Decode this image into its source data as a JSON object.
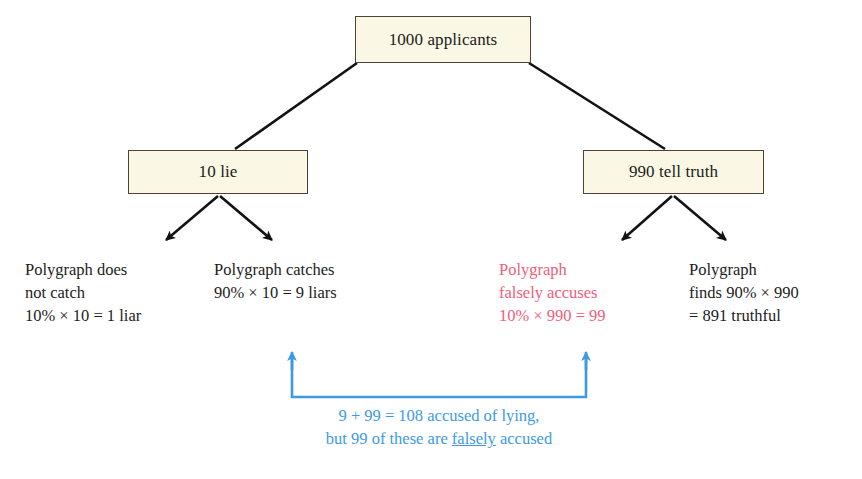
{
  "diagram": {
    "title_text": "Polygraph accuracy tree diagram",
    "colors": {
      "box_fill": "#faf7e4",
      "box_border": "#4a4336",
      "text": "#1c1c1c",
      "highlight_red": "#ef5d7a",
      "annotation_blue": "#3d9ae2",
      "background": "#ffffff"
    },
    "nodes": {
      "root": {
        "label": "1000 applicants"
      },
      "lie": {
        "label": "10 lie"
      },
      "truth": {
        "label": "990 tell truth"
      }
    },
    "leaves": {
      "not_caught": {
        "line1": "Polygraph does",
        "line2": "not catch",
        "line3": "10% × 10 = 1 liar"
      },
      "caught": {
        "line1": "Polygraph catches",
        "line2": "90% × 10 = 9 liars",
        "line3": ""
      },
      "falsely_accused": {
        "line1": "Polygraph",
        "line2": "falsely accuses",
        "line3": "10% × 990 = 99"
      },
      "found_truthful": {
        "line1": "Polygraph",
        "line2": "finds 90% × 990",
        "line3": "= 891 truthful"
      }
    },
    "annotation": {
      "line1": "9 + 99 = 108 accused of lying,",
      "line2_before": "but 99 of these are ",
      "line2_underlined": "falsely",
      "line2_after": " accused"
    }
  }
}
